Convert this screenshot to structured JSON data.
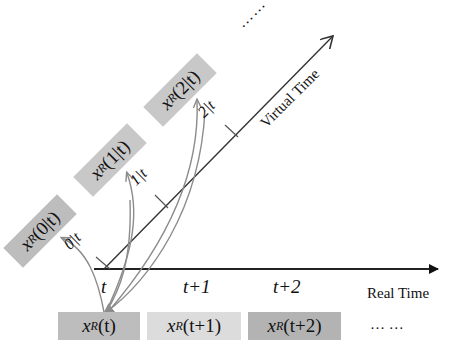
{
  "diagram": {
    "type": "time-axis prediction diagram",
    "colors": {
      "box_dark": "#bdbdbd",
      "box_light": "#dcdcdc",
      "axis": "#222222",
      "virtual_axis": "#333333",
      "arrow": "#8c8c8c"
    },
    "real_axis": {
      "label": "Real Time",
      "ticks": [
        "t",
        "t+1",
        "t+2"
      ],
      "ellipsis": "… …"
    },
    "virtual_axis": {
      "label": "Virtual Time",
      "ticks": [
        "0|t",
        "1|t",
        "2|t"
      ],
      "ellipsis": "……"
    },
    "predicted_states": [
      {
        "var": "x",
        "sup": "R",
        "arg": "(0|t)"
      },
      {
        "var": "x",
        "sup": "R",
        "arg": "(1|t)"
      },
      {
        "var": "x",
        "sup": "R",
        "arg": "(2|t)"
      }
    ],
    "real_states": [
      {
        "var": "x",
        "sup": "R",
        "arg": "(t)"
      },
      {
        "var": "x",
        "sup": "R",
        "arg": "(t+1)"
      },
      {
        "var": "x",
        "sup": "R",
        "arg": "(t+2)"
      }
    ]
  }
}
